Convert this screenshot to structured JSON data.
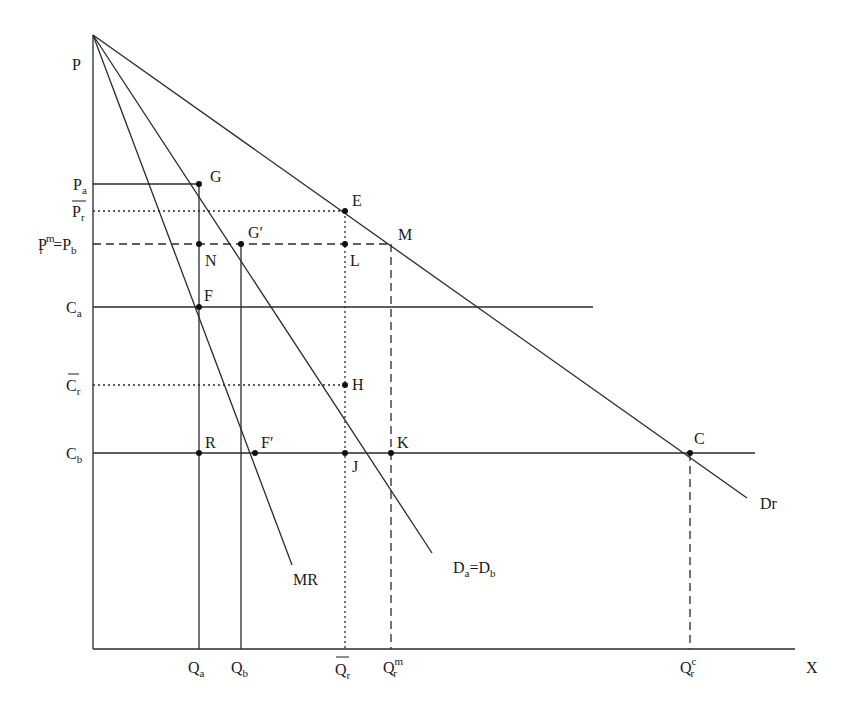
{
  "diagram": {
    "axes": {
      "y_label": "P",
      "x_label": "X"
    },
    "price_levels": [
      {
        "id": "Pa",
        "main": "P",
        "sub": "a",
        "y": 184
      },
      {
        "id": "Pr_bar",
        "main": "P",
        "sub": "r",
        "overline": true,
        "y": 211
      },
      {
        "id": "Prm_Pb",
        "main": "P",
        "sub": "r",
        "sup": "m",
        "suffix_main": "=P",
        "suffix_sub": "b",
        "y": 244
      },
      {
        "id": "Ca",
        "main": "C",
        "sub": "a",
        "y": 307
      },
      {
        "id": "Cr_bar",
        "main": "C",
        "sub": "r",
        "overline": true,
        "y": 385
      },
      {
        "id": "Cb",
        "main": "C",
        "sub": "b",
        "y": 453
      }
    ],
    "quantity_levels": [
      {
        "id": "Qa",
        "main": "Q",
        "sub": "a",
        "x": 199
      },
      {
        "id": "Qb",
        "main": "Q",
        "sub": "b",
        "x": 241
      },
      {
        "id": "Qr_bar",
        "main": "Q",
        "sub": "r",
        "overline": true,
        "x": 345
      },
      {
        "id": "Qrm",
        "main": "Q",
        "sub": "r",
        "sup": "m",
        "x": 391
      },
      {
        "id": "Qrc",
        "main": "Q",
        "sub": "r",
        "sup": "c",
        "x": 690
      }
    ],
    "curves": {
      "Dr": {
        "label": "Dr"
      },
      "Da_Db": {
        "label_main1": "D",
        "label_sub1": "a",
        "label_eq": "=D",
        "label_sub2": "b"
      },
      "MR": {
        "label": "MR"
      }
    },
    "points": {
      "G": "G",
      "G_prime": "G′",
      "E": "E",
      "M": "M",
      "N": "N",
      "L": "L",
      "F": "F",
      "H": "H",
      "R": "R",
      "F_prime": "F′",
      "J": "J",
      "K": "K",
      "C": "C"
    }
  }
}
